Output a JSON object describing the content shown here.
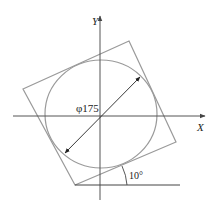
{
  "diagram": {
    "axes": {
      "x_label": "X",
      "y_label": "Y"
    },
    "circle": {
      "diameter_label": "φ175"
    },
    "square": {
      "rotation_label": "10°"
    },
    "colors": {
      "shape_stroke": "#9a9a9a",
      "axis_stroke": "#555555",
      "dimension_stroke": "#222222"
    }
  }
}
